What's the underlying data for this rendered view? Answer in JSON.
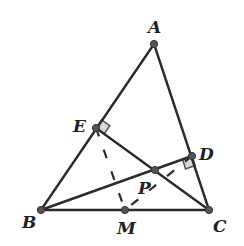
{
  "diagram": {
    "type": "geometry",
    "points": [
      {
        "id": "A",
        "label": "A",
        "x": 154,
        "y": 44,
        "lx": 148,
        "ly": 33
      },
      {
        "id": "E",
        "label": "E",
        "x": 96,
        "y": 128,
        "lx": 73,
        "ly": 132
      },
      {
        "id": "D",
        "label": "D",
        "x": 192,
        "y": 156,
        "lx": 199,
        "ly": 160
      },
      {
        "id": "P",
        "label": "P",
        "x": 155,
        "y": 170,
        "lx": 138,
        "ly": 194
      },
      {
        "id": "B",
        "label": "B",
        "x": 41,
        "y": 210,
        "lx": 22,
        "ly": 228
      },
      {
        "id": "M",
        "label": "M",
        "x": 125,
        "y": 210,
        "lx": 117,
        "ly": 234
      },
      {
        "id": "C",
        "label": "C",
        "x": 209,
        "y": 210,
        "lx": 213,
        "ly": 232
      }
    ],
    "segments": [
      {
        "from": "A",
        "to": "B",
        "style": "solid"
      },
      {
        "from": "A",
        "to": "C",
        "style": "solid"
      },
      {
        "from": "B",
        "to": "C",
        "style": "solid"
      },
      {
        "from": "E",
        "to": "C",
        "style": "solid"
      },
      {
        "from": "B",
        "to": "D",
        "style": "solid"
      },
      {
        "from": "E",
        "to": "M",
        "style": "dashed"
      },
      {
        "from": "D",
        "to": "M",
        "style": "dashed"
      }
    ],
    "right_angles": [
      {
        "at": "E",
        "between": [
          "A",
          "C"
        ]
      },
      {
        "at": "D",
        "between": [
          "C",
          "B"
        ]
      }
    ]
  }
}
